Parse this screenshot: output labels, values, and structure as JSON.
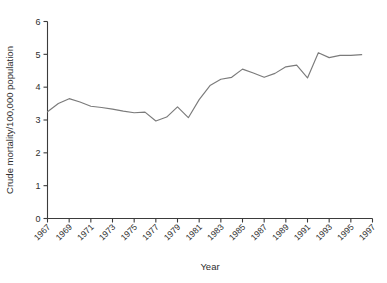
{
  "chart_data": {
    "type": "line",
    "title": "",
    "xlabel": "Year",
    "ylabel": "Crude mortality/100,000 population",
    "xlim": [
      1967,
      1997
    ],
    "ylim": [
      0,
      6
    ],
    "yticks": [
      0,
      1,
      2,
      3,
      4,
      5,
      6
    ],
    "ytick_labels": [
      "0",
      "1",
      "2",
      "3",
      "4",
      "5",
      "6"
    ],
    "xticks": [
      1967,
      1969,
      1971,
      1973,
      1975,
      1977,
      1979,
      1981,
      1983,
      1985,
      1987,
      1989,
      1991,
      1993,
      1995,
      1997
    ],
    "xtick_labels": [
      "1967",
      "1969",
      "1971",
      "1973",
      "1975",
      "1977",
      "1979",
      "1981",
      "1983",
      "1985",
      "1987",
      "1989",
      "1991",
      "1993",
      "1995",
      "1997"
    ],
    "grid": false,
    "legend": false,
    "legend_position": "none",
    "line_color": "#7b7b7b",
    "axis_color": "#3b3b3b",
    "background_color": "#ffffff",
    "x": [
      1967,
      1968,
      1969,
      1970,
      1971,
      1972,
      1973,
      1974,
      1975,
      1976,
      1977,
      1978,
      1979,
      1980,
      1981,
      1982,
      1983,
      1984,
      1985,
      1986,
      1987,
      1988,
      1989,
      1990,
      1991,
      1992,
      1993,
      1994,
      1995,
      1996
    ],
    "values": [
      3.25,
      3.5,
      3.65,
      3.55,
      3.42,
      3.38,
      3.33,
      3.27,
      3.22,
      3.24,
      2.97,
      3.09,
      3.4,
      3.07,
      3.62,
      4.05,
      4.24,
      4.3,
      4.55,
      4.43,
      4.3,
      4.42,
      4.62,
      4.67,
      4.28,
      5.05,
      4.9,
      4.97,
      4.97,
      4.99
    ],
    "series": [
      {
        "name": "Crude mortality",
        "values": [
          3.25,
          3.5,
          3.65,
          3.55,
          3.42,
          3.38,
          3.33,
          3.27,
          3.22,
          3.24,
          2.97,
          3.09,
          3.4,
          3.07,
          3.62,
          4.05,
          4.24,
          4.3,
          4.55,
          4.43,
          4.3,
          4.42,
          4.62,
          4.67,
          4.28,
          5.05,
          4.9,
          4.97,
          4.97,
          4.99
        ]
      }
    ]
  }
}
